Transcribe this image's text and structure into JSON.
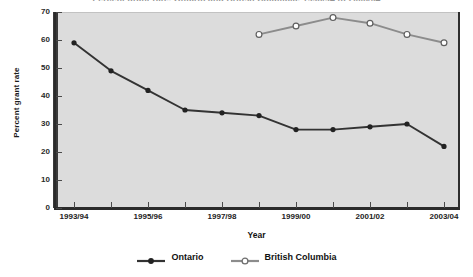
{
  "chart_data": {
    "type": "line",
    "title": "Percent grant rate, Ontario and British Columbia, 1993/94 to 2003/04",
    "xlabel": "Year",
    "ylabel": "Percent grant rate",
    "x": [
      "1993/94",
      "1994/95",
      "1995/96",
      "1996/97",
      "1997/98",
      "1998/99",
      "1999/00",
      "2000/01",
      "2001/02",
      "2002/03",
      "2003/04"
    ],
    "tick_labels": [
      "1993/94",
      "",
      "1995/96",
      "",
      "1997/98",
      "",
      "1999/00",
      "",
      "2001/02",
      "",
      "2003/04"
    ],
    "ylim": [
      0,
      70
    ],
    "yticks": [
      0,
      10,
      20,
      30,
      40,
      50,
      60,
      70
    ],
    "grid": false,
    "legend_position": "bottom",
    "series": [
      {
        "name": "Ontario",
        "marker": "filled-circle",
        "color": "#333333",
        "values": [
          59,
          49,
          42,
          35,
          34,
          33,
          28,
          28,
          29,
          30,
          22
        ]
      },
      {
        "name": "British Columbia",
        "marker": "open-circle",
        "color": "#8c8c8c",
        "values": [
          null,
          null,
          null,
          null,
          null,
          62,
          65,
          68,
          66,
          62,
          59
        ]
      }
    ]
  },
  "colors": {
    "panel_background": "#dcdcdc",
    "axis": "#2b2b2b",
    "ontario": "#333333",
    "british_columbia": "#8c8c8c",
    "page_background": "#ffffff"
  },
  "legend": {
    "entries": [
      {
        "label": "Ontario"
      },
      {
        "label": "British Columbia"
      }
    ]
  }
}
